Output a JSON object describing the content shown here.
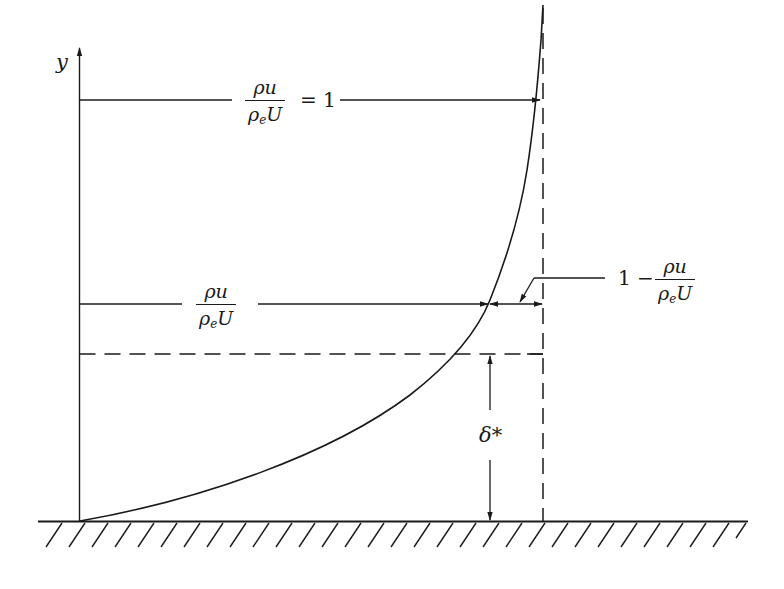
{
  "diagram": {
    "axis": {
      "y_label": "y"
    },
    "labels": {
      "top_fraction": {
        "numerator": "ρu",
        "denominator_main": "ρ",
        "denominator_sub": "e",
        "denominator_tail": "U"
      },
      "top_equals": "= 1",
      "mid_fraction": {
        "numerator": "ρu",
        "denominator_main": "ρ",
        "denominator_sub": "e",
        "denominator_tail": "U"
      },
      "deficit_prefix": "1 −",
      "deficit_fraction": {
        "numerator": "ρu",
        "denominator_main": "ρ",
        "denominator_sub": "e",
        "denominator_tail": "U"
      },
      "delta_star": "δ*"
    },
    "elements": [
      "y-axis with arrow",
      "wall with hatching",
      "velocity profile curve ρu/ρeU",
      "edge line ρu/ρeU = 1 (dashed vertical)",
      "dashed horizontal line at y = δ*",
      "dimension arrow for δ*",
      "deficit dimension 1 − ρu/ρeU"
    ],
    "colors": {
      "ink": "#1a1a1a",
      "background": "#ffffff"
    }
  }
}
